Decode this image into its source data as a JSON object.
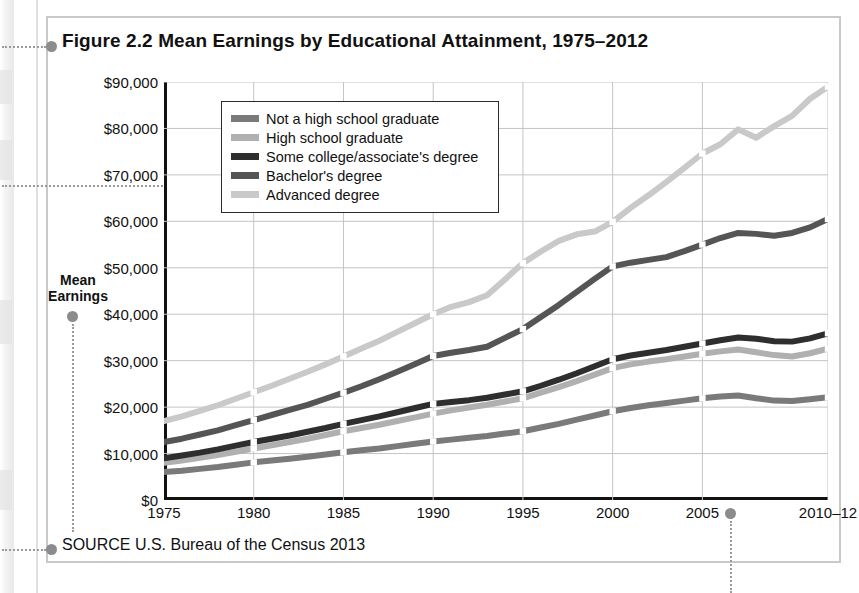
{
  "figure": {
    "title": "Figure 2.2  Mean Earnings by Educational Attainment, 1975–2012",
    "source": "SOURCE  U.S. Bureau of the Census 2013",
    "axis_label_line1": "Mean",
    "axis_label_line2": "Earnings"
  },
  "legend": {
    "items": [
      {
        "label": "Not a high school graduate",
        "color": "#7a7a7a"
      },
      {
        "label": "High school graduate",
        "color": "#b0b0b0"
      },
      {
        "label": "Some college/associate's degree",
        "color": "#2e2e2e"
      },
      {
        "label": "Bachelor's degree",
        "color": "#555555"
      },
      {
        "label": "Advanced degree",
        "color": "#c9c9c9"
      }
    ]
  },
  "chart_data": {
    "type": "line",
    "title": "Figure 2.2  Mean Earnings by Educational Attainment, 1975–2012",
    "xlabel": "",
    "ylabel": "Mean Earnings",
    "ylim": [
      0,
      90000
    ],
    "ytick_labels": [
      "$90,000",
      "$80,000",
      "$70,000",
      "$60,000",
      "$50,000",
      "$40,000",
      "$30,000",
      "$20,000",
      "$10,000",
      "$0"
    ],
    "ytick_values": [
      90000,
      80000,
      70000,
      60000,
      50000,
      40000,
      30000,
      20000,
      10000,
      0
    ],
    "xtick_labels": [
      "1975",
      "1980",
      "1985",
      "1990",
      "1995",
      "2000",
      "2005",
      "2010–12"
    ],
    "xtick_values": [
      1975,
      1980,
      1985,
      1990,
      1995,
      2000,
      2005,
      2012
    ],
    "xlim": [
      1975,
      2012
    ],
    "grid": true,
    "legend_position": "upper-left-inside",
    "x": [
      1975,
      1976,
      1977,
      1978,
      1979,
      1980,
      1981,
      1982,
      1983,
      1984,
      1985,
      1986,
      1987,
      1988,
      1989,
      1990,
      1991,
      1992,
      1993,
      1994,
      1995,
      1996,
      1997,
      1998,
      1999,
      2000,
      2001,
      2002,
      2003,
      2004,
      2005,
      2006,
      2007,
      2008,
      2009,
      2010,
      2011,
      2012
    ],
    "series": [
      {
        "name": "Not a high school graduate",
        "color": "#7a7a7a",
        "values": [
          6000,
          6300,
          6700,
          7100,
          7600,
          8100,
          8500,
          8900,
          9300,
          9800,
          10300,
          10700,
          11100,
          11600,
          12100,
          12600,
          13000,
          13400,
          13800,
          14300,
          14800,
          15600,
          16400,
          17300,
          18200,
          19100,
          19800,
          20400,
          20900,
          21400,
          21900,
          22300,
          22500,
          21900,
          21400,
          21300,
          21700,
          22100
        ]
      },
      {
        "name": "High school graduate",
        "color": "#b0b0b0",
        "values": [
          8000,
          8500,
          9100,
          9700,
          10400,
          11100,
          11800,
          12500,
          13200,
          14000,
          14800,
          15500,
          16200,
          17000,
          17800,
          18600,
          19300,
          19900,
          20500,
          21200,
          21900,
          23100,
          24300,
          25600,
          27000,
          28400,
          29200,
          29800,
          30300,
          30900,
          31500,
          32000,
          32400,
          31800,
          31200,
          30900,
          31600,
          32600
        ]
      },
      {
        "name": "Some college/associate's degree",
        "color": "#2e2e2e",
        "values": [
          9000,
          9600,
          10200,
          10900,
          11700,
          12500,
          13200,
          13900,
          14700,
          15500,
          16400,
          17200,
          18000,
          18900,
          19800,
          20700,
          21100,
          21500,
          22000,
          22700,
          23400,
          24600,
          25900,
          27300,
          28800,
          30300,
          31100,
          31700,
          32300,
          33000,
          33700,
          34400,
          35000,
          34700,
          34200,
          34100,
          34800,
          35900
        ]
      },
      {
        "name": "Bachelor's degree",
        "color": "#555555",
        "values": [
          12500,
          13200,
          14100,
          15000,
          16100,
          17200,
          18300,
          19400,
          20500,
          21800,
          23100,
          24500,
          26000,
          27600,
          29300,
          31000,
          31700,
          32300,
          33000,
          34900,
          36800,
          39400,
          42000,
          44800,
          47600,
          50300,
          51100,
          51700,
          52300,
          53600,
          55000,
          56400,
          57500,
          57300,
          56900,
          57500,
          58700,
          60500
        ]
      },
      {
        "name": "Advanced degree",
        "color": "#c9c9c9",
        "values": [
          17000,
          18000,
          19200,
          20400,
          21800,
          23200,
          24600,
          26100,
          27600,
          29200,
          30900,
          32600,
          34300,
          36200,
          38100,
          40000,
          41600,
          42600,
          44100,
          47500,
          51000,
          53500,
          55800,
          57200,
          57800,
          59900,
          62900,
          65600,
          68500,
          71500,
          74600,
          76600,
          79800,
          78000,
          80500,
          82700,
          86400,
          89000
        ]
      }
    ]
  },
  "callouts": {
    "title_dot": true,
    "source_dot": true,
    "axis_label_dot": true,
    "y70000_dot": true,
    "xaxis_dot": true
  }
}
